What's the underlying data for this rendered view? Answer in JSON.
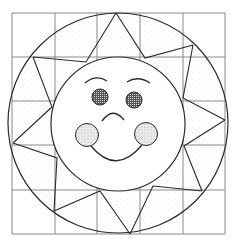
{
  "colors": {
    "background": "#ffffff",
    "grid": "#8a8a8a",
    "line": "#2a2a2a",
    "stipple": "#bdbdbd"
  },
  "grid": {
    "xs": [
      12,
      55,
      97,
      140,
      183,
      225
    ],
    "ys": [
      13,
      57,
      101,
      145,
      190,
      234
    ]
  },
  "outer_circle": {
    "cx": 118,
    "cy": 123,
    "r": 110
  },
  "inner_circle": {
    "cx": 118,
    "cy": 124,
    "r": 67
  },
  "rays": {
    "tips": [
      [
        116,
        13
      ],
      [
        193,
        45
      ],
      [
        225,
        120
      ],
      [
        202,
        191
      ],
      [
        130,
        234
      ],
      [
        54,
        211
      ],
      [
        13,
        143
      ],
      [
        33,
        57
      ]
    ],
    "valleys": [
      [
        145,
        58
      ],
      [
        183,
        98
      ],
      [
        184,
        146
      ],
      [
        153,
        186
      ],
      [
        100,
        191
      ],
      [
        57,
        158
      ],
      [
        52,
        107
      ],
      [
        86,
        62
      ]
    ]
  },
  "face": {
    "left_eyebrow": "M85 83 Q96 74 107 81",
    "right_eyebrow": "M127 82 Q138 75 150 83",
    "left_eye": {
      "cx": 100,
      "cy": 97,
      "r": 8
    },
    "right_eye": {
      "cx": 134,
      "cy": 100,
      "r": 8
    },
    "frown": "M102 121 Q113 106 124 120",
    "left_cheek": {
      "cx": 87,
      "cy": 135,
      "r": 11.5
    },
    "right_cheek": {
      "cx": 146,
      "cy": 134,
      "r": 11.5
    },
    "smile": "M91 146 Q116 176 142 145"
  }
}
